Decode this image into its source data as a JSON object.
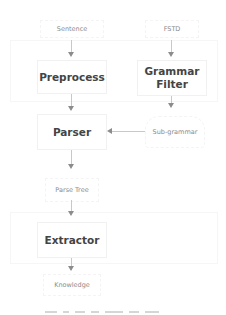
{
  "diagram": {
    "inputs": {
      "sentence": "Sentence",
      "fstd": "FSTD"
    },
    "process_boxes": {
      "preprocess": "Preprocess",
      "grammar_filter_line1": "Grammar",
      "grammar_filter_line2": "Filter",
      "parser": "Parser",
      "extractor": "Extractor"
    },
    "data_labels": {
      "sub_grammar": "Sub-grammar",
      "parse_tree": "Parse Tree",
      "knowledge": "Knowledge"
    },
    "edges": [
      {
        "from": "Sentence",
        "to": "Preprocess"
      },
      {
        "from": "Preprocess",
        "to": "Parser"
      },
      {
        "from": "FSTD",
        "to": "Grammar Filter"
      },
      {
        "from": "Grammar Filter",
        "to": "Sub-grammar"
      },
      {
        "from": "Sub-grammar",
        "to": "Parser"
      },
      {
        "from": "Parser",
        "to": "Parse Tree"
      },
      {
        "from": "Parse Tree",
        "to": "Extractor"
      },
      {
        "from": "Extractor",
        "to": "Knowledge"
      }
    ],
    "colors": {
      "box_text": "#444444",
      "label_text": "#8a8a8a",
      "arrow": "#8c8c8c"
    }
  }
}
